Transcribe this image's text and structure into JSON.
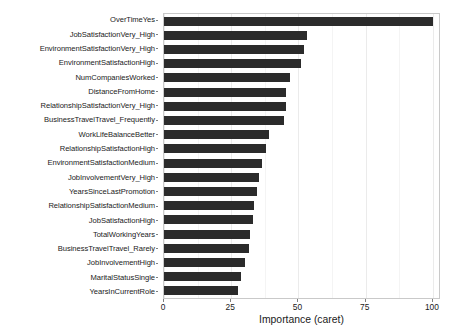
{
  "chart_data": {
    "type": "bar",
    "orientation": "horizontal",
    "title": "",
    "subtitle": "",
    "xlabel": "Importance (caret)",
    "ylabel": "",
    "xlim": [
      0,
      103
    ],
    "xticks": [
      0,
      25,
      50,
      75,
      100
    ],
    "xtick_labels": [
      "0",
      "25",
      "50",
      "75",
      "100"
    ],
    "x_minor_ticks": [
      12.5,
      37.5,
      62.5,
      87.5
    ],
    "grid": "vertical-only",
    "legend": "none",
    "bar_color": "#2b2b2b",
    "panel_background": "#ffffff",
    "panel_border_color": "#c9c9c9",
    "grid_major_color": "#ebebeb",
    "grid_minor_color": "#f4f4f4",
    "categories": [
      "OverTimeYes",
      "JobSatisfactionVery_High",
      "EnvironmentSatisfactionVery_High",
      "EnvironmentSatisfactionHigh",
      "NumCompaniesWorked",
      "DistanceFromHome",
      "RelationshipSatisfactionVery_High",
      "BusinessTravelTravel_Frequently",
      "WorkLifeBalanceBetter",
      "RelationshipSatisfactionHigh",
      "EnvironmentSatisfactionMedium",
      "JobInvolvementVery_High",
      "YearsSinceLastPromotion",
      "RelationshipSatisfactionMedium",
      "JobSatisfactionHigh",
      "TotalWorkingYears",
      "BusinessTravelTravel_Rarely",
      "JobInvolvementHigh",
      "MaritalStatusSingle",
      "YearsInCurrentRole"
    ],
    "values": [
      100.0,
      53.0,
      52.0,
      51.0,
      47.0,
      45.5,
      45.5,
      44.5,
      39.0,
      38.0,
      36.5,
      35.5,
      34.5,
      33.5,
      33.0,
      32.0,
      31.5,
      30.0,
      28.5,
      27.5
    ]
  }
}
